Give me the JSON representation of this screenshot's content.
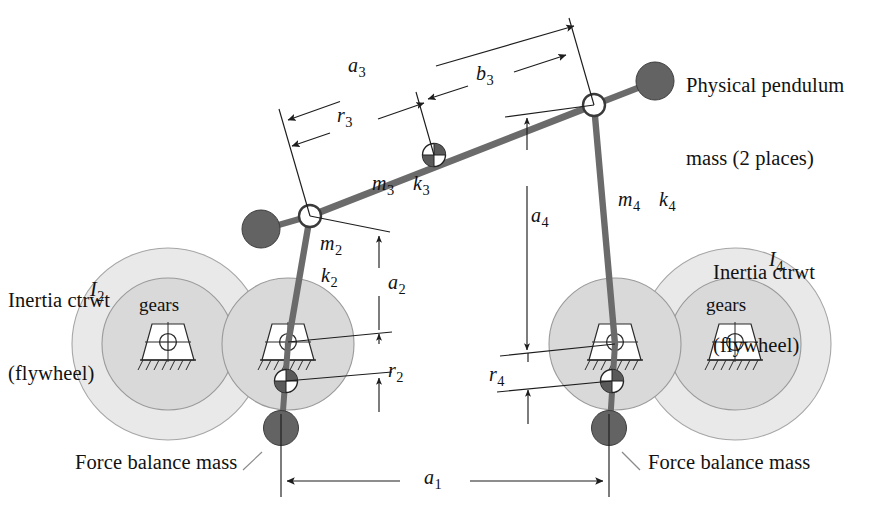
{
  "figure": {
    "type": "diagram",
    "width": 883,
    "height": 524,
    "background": "#ffffff"
  },
  "colors": {
    "link": "#6b6b6b",
    "link_dark": "#4a4a4a",
    "mass": "#636363",
    "mass_stroke": "#3d3d3d",
    "flywheel_outer": "#e9e9e9",
    "flywheel_inner": "#d9d9d9",
    "flywheel_stroke": "#9a9a9a",
    "dimension": "#2a2a2a",
    "text": "#111111",
    "pivot_fill": "#ffffff",
    "pivot_stroke": "#3a3a3a"
  },
  "annotations": {
    "physical_pendulum": {
      "line1": "Physical pendulum",
      "line2": "mass (2 places)"
    },
    "inertia_left": {
      "line1": "Inertia ctrwt",
      "line2": "(flywheel)"
    },
    "inertia_right": {
      "line1": "Inertia ctrwt",
      "line2": "(flywheel)"
    },
    "force_balance_left": "Force balance mass",
    "force_balance_right": "Force balance mass",
    "gears_left": "gears",
    "gears_right": "gears"
  },
  "symbols": {
    "a1": {
      "base": "a",
      "sub": "1",
      "meaning": "ground link length"
    },
    "a2": {
      "base": "a",
      "sub": "2",
      "meaning": "crank link length"
    },
    "a3": {
      "base": "a",
      "sub": "3",
      "meaning": "coupler link length"
    },
    "a4": {
      "base": "a",
      "sub": "4",
      "meaning": "rocker link length"
    },
    "b3": {
      "base": "b",
      "sub": "3",
      "meaning": "coupler CG to rear pivot distance"
    },
    "r2": {
      "base": "r",
      "sub": "2",
      "meaning": "crank counterweight radius"
    },
    "r3": {
      "base": "r",
      "sub": "3",
      "meaning": "coupler CG radius"
    },
    "r4": {
      "base": "r",
      "sub": "4",
      "meaning": "rocker counterweight radius"
    },
    "m2": {
      "base": "m",
      "sub": "2",
      "meaning": "crank mass"
    },
    "m3": {
      "base": "m",
      "sub": "3",
      "meaning": "coupler mass"
    },
    "m4": {
      "base": "m",
      "sub": "4",
      "meaning": "rocker mass"
    },
    "k2": {
      "base": "k",
      "sub": "2",
      "meaning": "crank radius of gyration"
    },
    "k3": {
      "base": "k",
      "sub": "3",
      "meaning": "coupler radius of gyration"
    },
    "k4": {
      "base": "k",
      "sub": "4",
      "meaning": "rocker radius of gyration"
    },
    "I2": {
      "base": "I",
      "sub": "2",
      "meaning": "left flywheel inertia"
    },
    "I4": {
      "base": "I",
      "sub": "4",
      "meaning": "right flywheel inertia"
    }
  },
  "dimensions": [
    {
      "name": "a3",
      "orientation": "oblique",
      "style": "double-arrow"
    },
    {
      "name": "r3",
      "orientation": "oblique",
      "style": "double-arrow"
    },
    {
      "name": "b3",
      "orientation": "oblique",
      "style": "double-arrow"
    },
    {
      "name": "a2",
      "orientation": "vertical",
      "style": "double-arrow"
    },
    {
      "name": "r2",
      "orientation": "vertical",
      "style": "double-arrow"
    },
    {
      "name": "a4",
      "orientation": "vertical",
      "style": "double-arrow"
    },
    {
      "name": "r4",
      "orientation": "vertical",
      "style": "double-arrow"
    },
    {
      "name": "a1",
      "orientation": "horizontal",
      "style": "double-arrow"
    }
  ]
}
